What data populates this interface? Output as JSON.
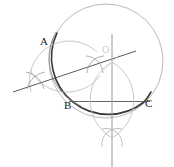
{
  "figure": {
    "kind": "geometric-construction",
    "width": 174,
    "height": 167,
    "background": "#ffffff"
  },
  "labels": {
    "vertex_a": "A",
    "vertex_b": "B",
    "vertex_c": "C",
    "center_o": "O"
  },
  "colors": {
    "heavy_stroke": "#3a3a3a",
    "medium_stroke": "#6b6b6b",
    "light_stroke": "#b9b9b9",
    "faint_stroke": "#cfcfcf",
    "label_text": "#222222",
    "center_label_text": "#c9c9c9"
  },
  "geometry": {
    "circumcircle": {
      "cx": 106,
      "cy": 61,
      "r": 57
    },
    "center_point": {
      "x": 112,
      "y": 62
    },
    "points": {
      "A": {
        "x": 58,
        "y": 35
      },
      "B": {
        "x": 73,
        "y": 101
      },
      "C": {
        "x": 143,
        "y": 101
      }
    },
    "chord_bc": {
      "x1": 73,
      "y1": 101,
      "x2": 143,
      "y2": 101
    },
    "bisector_line_ab": {
      "x1": 13,
      "y1": 92,
      "x2": 136,
      "y2": 51
    },
    "bisector_line_bc": {
      "x1": 112,
      "y1": 34,
      "x2": 112,
      "y2": 167
    },
    "arc_crossings": [
      {
        "x": 35,
        "y": 80
      },
      {
        "x": 95,
        "y": 65
      },
      {
        "x": 112,
        "y": 138
      },
      {
        "x": 112,
        "y": 62
      }
    ],
    "vesica": {
      "x": 112,
      "top_y": 62,
      "bottom_y": 138,
      "half_width": 17
    }
  },
  "label_positions": {
    "A": {
      "left": 40,
      "top": 36
    },
    "B": {
      "left": 64,
      "top": 100
    },
    "C": {
      "left": 145,
      "top": 98
    },
    "O": {
      "left": 102,
      "top": 45
    }
  }
}
